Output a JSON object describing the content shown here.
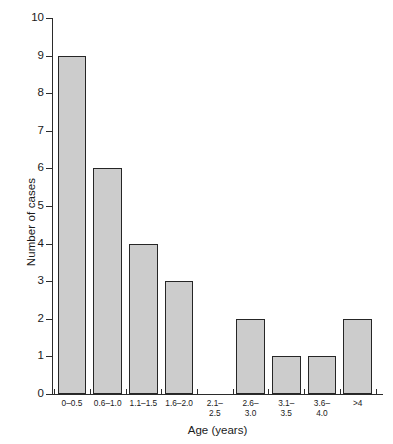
{
  "chart_data": {
    "type": "bar",
    "title": "",
    "xlabel": "Age (years)",
    "ylabel": "Number of cases",
    "categories": [
      "0–0.5",
      "0.6–1.0",
      "1.1–1.5",
      "1.6–2.0",
      "2.1–\n2.5",
      "2.6–\n3.0",
      "3.1–\n3.5",
      "3.6–\n4.0",
      ">4"
    ],
    "values": [
      9,
      6,
      4,
      3,
      0,
      2,
      1,
      1,
      2
    ],
    "ylim": [
      0,
      10
    ],
    "yticks": [
      "0",
      "1",
      "2",
      "3",
      "4",
      "5",
      "6",
      "7",
      "8",
      "9",
      "10"
    ],
    "grid": false,
    "legend": false,
    "bar_fill_color": "#cccccc",
    "bar_edge_color": "#262626",
    "axis_color": "#2b2b2b",
    "background_color": "#ffffff"
  },
  "axes": {
    "y_title": "Number of cases",
    "x_title": "Age (years)"
  }
}
